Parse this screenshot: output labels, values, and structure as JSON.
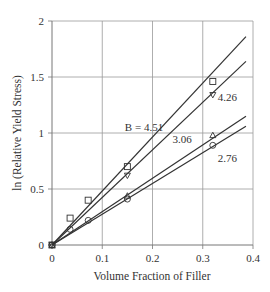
{
  "chart_data": {
    "type": "line",
    "title": "",
    "xlabel": "Volume Fraction of Filler",
    "ylabel": "ln (Relative Yield Stress)",
    "xlim": [
      0,
      0.4
    ],
    "ylim": [
      0,
      2
    ],
    "x_ticks": [
      "0",
      "0.1",
      "0.2",
      "0.3",
      "0.4"
    ],
    "y_ticks": [
      "0",
      "0.5",
      "1",
      "1.5",
      "2"
    ],
    "grid": true,
    "legend": "none (inline line labels)",
    "series": [
      {
        "name": "B = 4.51",
        "marker": "square",
        "fit_line": {
          "x": [
            0,
            0.386
          ],
          "y": [
            0,
            1.86
          ]
        },
        "points": [
          {
            "x": 0,
            "y": 0
          },
          {
            "x": 0.036,
            "y": 0.24
          },
          {
            "x": 0.072,
            "y": 0.4
          },
          {
            "x": 0.15,
            "y": 0.7
          },
          {
            "x": 0.32,
            "y": 1.46
          }
        ]
      },
      {
        "name": "4.26",
        "marker": "triangle-down",
        "fit_line": {
          "x": [
            0,
            0.386
          ],
          "y": [
            0,
            1.64
          ]
        },
        "points": [
          {
            "x": 0,
            "y": 0
          },
          {
            "x": 0.15,
            "y": 0.62
          },
          {
            "x": 0.32,
            "y": 1.34
          }
        ]
      },
      {
        "name": "3.06",
        "marker": "triangle-up",
        "fit_line": {
          "x": [
            0,
            0.386
          ],
          "y": [
            0,
            1.15
          ]
        },
        "points": [
          {
            "x": 0,
            "y": 0
          },
          {
            "x": 0.15,
            "y": 0.44
          },
          {
            "x": 0.32,
            "y": 0.98
          }
        ]
      },
      {
        "name": "2.76",
        "marker": "circle",
        "fit_line": {
          "x": [
            0,
            0.386
          ],
          "y": [
            0,
            1.06
          ]
        },
        "points": [
          {
            "x": 0,
            "y": 0
          },
          {
            "x": 0.036,
            "y": 0.14
          },
          {
            "x": 0.072,
            "y": 0.22
          },
          {
            "x": 0.15,
            "y": 0.41
          },
          {
            "x": 0.32,
            "y": 0.89
          }
        ]
      }
    ],
    "annotations": [
      {
        "text": "B = 4.51",
        "x": 0.145,
        "y": 1.05
      },
      {
        "text": "4.26",
        "x": 0.33,
        "y": 1.32
      },
      {
        "text": "3.06",
        "x": 0.24,
        "y": 0.95
      },
      {
        "text": "2.76",
        "x": 0.33,
        "y": 0.78
      }
    ]
  },
  "colors": {
    "line": "#333333",
    "grid": "#999999",
    "axis": "#777777"
  }
}
